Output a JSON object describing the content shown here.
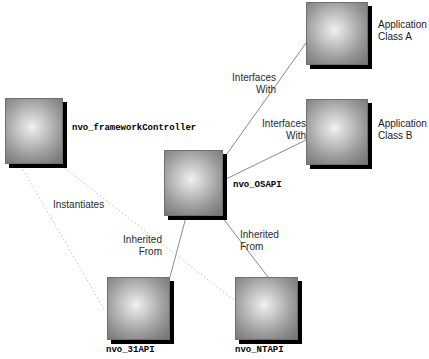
{
  "diagram": {
    "type": "class-relationship",
    "background_color": "#ffffff",
    "nodes": [
      {
        "id": "framework-controller",
        "label": "nvo_frameworkController",
        "label_style": "mono-bold",
        "label_position": "right",
        "x": 5,
        "y": 98,
        "w": 58,
        "h": 66
      },
      {
        "id": "osapi",
        "label": "nvo_OSAPI",
        "label_style": "mono-bold",
        "label_position": "right",
        "x": 164,
        "y": 150,
        "w": 59,
        "h": 66
      },
      {
        "id": "application-class-a",
        "label": "Application\nClass A",
        "label_style": "sans",
        "label_position": "right",
        "x": 306,
        "y": 2,
        "w": 62,
        "h": 63
      },
      {
        "id": "application-class-b",
        "label": "Application\nClass B",
        "label_style": "sans",
        "label_position": "right",
        "x": 306,
        "y": 99,
        "w": 62,
        "h": 66
      },
      {
        "id": "nvo-31api",
        "label": "nvo_31API",
        "label_style": "mono-bold",
        "label_position": "bottom",
        "x": 107,
        "y": 277,
        "w": 63,
        "h": 63
      },
      {
        "id": "nvo-ntapi",
        "label": "nvo_NTAPI",
        "label_style": "mono-bold",
        "label_position": "bottom",
        "x": 235,
        "y": 277,
        "w": 63,
        "h": 63
      }
    ],
    "edges": [
      {
        "id": "osapi-to-class-a",
        "from": "osapi",
        "to": "application-class-a",
        "label": "Interfaces\nWith",
        "style": "solid",
        "color": "#808080"
      },
      {
        "id": "osapi-to-class-b",
        "from": "osapi",
        "to": "application-class-b",
        "label": "Interfaces\nWith",
        "style": "solid",
        "color": "#808080"
      },
      {
        "id": "nvo-31api-to-osapi",
        "from": "nvo-31api",
        "to": "osapi",
        "label": "Inherited\nFrom",
        "style": "solid",
        "color": "#808080"
      },
      {
        "id": "nvo-ntapi-to-osapi",
        "from": "nvo-ntapi",
        "to": "osapi",
        "label": "Inherited\nFrom",
        "style": "solid",
        "color": "#808080"
      },
      {
        "id": "controller-instantiates-31api",
        "from": "framework-controller",
        "to": "nvo-31api",
        "label": "Instantiates",
        "style": "dotted",
        "color": "#b8b8b8"
      },
      {
        "id": "controller-instantiates-ntapi",
        "from": "framework-controller",
        "to": "nvo-ntapi",
        "label": "",
        "style": "dotted",
        "color": "#b8b8b8"
      }
    ],
    "edge_labels": [
      {
        "id": "interfaces-with-a",
        "text": "Interfaces\nWith",
        "x": 216,
        "y": 72,
        "w": 60,
        "align": "right"
      },
      {
        "id": "interfaces-with-b",
        "text": "Interfaces\nWith",
        "x": 246,
        "y": 118,
        "w": 60,
        "align": "right"
      },
      {
        "id": "instantiates",
        "text": "Instantiates",
        "x": 53,
        "y": 199,
        "w": 70,
        "align": "left"
      },
      {
        "id": "inherited-from-left",
        "text": "Inherited\nFrom",
        "x": 106,
        "y": 234,
        "w": 56,
        "align": "right"
      },
      {
        "id": "inherited-from-right",
        "text": "Inherited\nFrom",
        "x": 240,
        "y": 229,
        "w": 56,
        "align": "left"
      }
    ]
  }
}
